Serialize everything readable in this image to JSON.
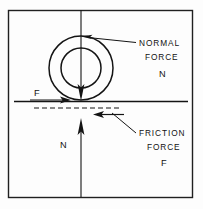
{
  "figure": {
    "background_color": "#fdfdfd",
    "ink_color": "#141414",
    "frame": {
      "name": "outer-frame",
      "x": 8,
      "y": 10,
      "width": 185,
      "height": 188
    }
  },
  "labels": {
    "normal_force_line1": "NORMAL",
    "normal_force_line2": "FORCE",
    "normal_force_symbol": "N",
    "friction_force_line1": "FRICTION",
    "friction_force_line2": "FORCE",
    "friction_force_symbol": "F",
    "applied_friction_symbol": "F",
    "reaction_normal_symbol": "N"
  },
  "geometry": {
    "wheel_center_x": 81,
    "wheel_center_y": 68,
    "outer_radius": 32,
    "inner_radius": 20,
    "ground_line_y": 101,
    "ground_line_x1": 14,
    "ground_line_x2": 188,
    "dashed_line_y": 108,
    "dashed_line_x1": 34,
    "dashed_line_x2": 122,
    "weight_arrow_top_y": 10,
    "weight_arrow_tip_y": 100,
    "reaction_arrow_tip_y": 118,
    "reaction_arrow_bottom_y": 197
  },
  "annotations": {
    "normal_force_leader": "leader line from NORMAL FORCE label to vertical load line",
    "friction_force_leader": "leader line from FRICTION FORCE label to leftward friction arrow",
    "applied_force_arrow": "short rightward arrow at contact patch labelled F",
    "reaction_force_arrow": "upward arrow below ground labelled N"
  }
}
